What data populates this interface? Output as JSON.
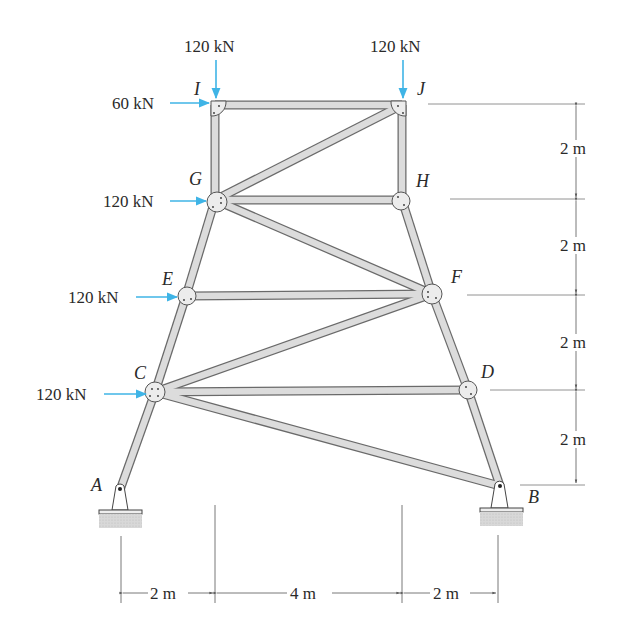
{
  "diagram": {
    "type": "truss",
    "joints": [
      {
        "id": "A",
        "x": 120,
        "y": 490,
        "label_x": 90,
        "label_y": 476
      },
      {
        "id": "B",
        "x": 500,
        "y": 486,
        "label_x": 527,
        "label_y": 488
      },
      {
        "id": "C",
        "x": 155,
        "y": 392,
        "label_x": 133,
        "label_y": 364
      },
      {
        "id": "D",
        "x": 468,
        "y": 390,
        "label_x": 480,
        "label_y": 364
      },
      {
        "id": "E",
        "x": 186,
        "y": 296,
        "label_x": 162,
        "label_y": 270
      },
      {
        "id": "F",
        "x": 432,
        "y": 294,
        "label_x": 450,
        "label_y": 268
      },
      {
        "id": "G",
        "x": 215,
        "y": 200,
        "label_x": 189,
        "label_y": 170
      },
      {
        "id": "H",
        "x": 402,
        "y": 200,
        "label_x": 416,
        "label_y": 172
      },
      {
        "id": "I",
        "x": 215,
        "y": 105,
        "label_x": 193,
        "label_y": 80
      },
      {
        "id": "J",
        "x": 402,
        "y": 105,
        "label_x": 416,
        "label_y": 80
      }
    ],
    "members": [
      [
        "I",
        "J"
      ],
      [
        "I",
        "G"
      ],
      [
        "J",
        "H"
      ],
      [
        "G",
        "J"
      ],
      [
        "G",
        "H"
      ],
      [
        "G",
        "E"
      ],
      [
        "H",
        "F"
      ],
      [
        "G",
        "F"
      ],
      [
        "E",
        "F"
      ],
      [
        "E",
        "C"
      ],
      [
        "F",
        "D"
      ],
      [
        "C",
        "F"
      ],
      [
        "C",
        "D"
      ],
      [
        "C",
        "A"
      ],
      [
        "D",
        "B"
      ],
      [
        "C",
        "B"
      ]
    ],
    "loads": [
      {
        "joint": "I",
        "value": "120 kN",
        "direction": "down",
        "label_x": 186,
        "label_y": 12
      },
      {
        "joint": "J",
        "value": "120 kN",
        "direction": "down",
        "label_x": 370,
        "label_y": 12
      },
      {
        "joint": "I",
        "value": "60 kN",
        "direction": "right",
        "label_x": 112,
        "label_y": 96
      },
      {
        "joint": "G",
        "value": "120 kN",
        "direction": "right",
        "label_x": 103,
        "label_y": 192
      },
      {
        "joint": "E",
        "value": "120 kN",
        "direction": "right",
        "label_x": 66,
        "label_y": 290
      },
      {
        "joint": "C",
        "value": "120 kN",
        "direction": "right",
        "label_x": 36,
        "label_y": 386
      }
    ],
    "supports": [
      {
        "joint": "A",
        "type": "pin"
      },
      {
        "joint": "B",
        "type": "pin"
      }
    ],
    "vertical_dimensions": [
      {
        "label": "2 m",
        "y1": 105,
        "y2": 200,
        "label_y": 145
      },
      {
        "label": "2 m",
        "y1": 200,
        "y2": 295,
        "label_y": 240
      },
      {
        "label": "2 m",
        "y1": 295,
        "y2": 390,
        "label_y": 336
      },
      {
        "label": "2 m",
        "y1": 390,
        "y2": 485,
        "label_y": 433
      }
    ],
    "horizontal_dimensions": [
      {
        "label": "2 m",
        "x1": 121,
        "x2": 215
      },
      {
        "label": "4 m",
        "x1": 215,
        "x2": 402
      },
      {
        "label": "2 m",
        "x1": 402,
        "x2": 498
      }
    ],
    "colors": {
      "load_arrow": "#3fb4e6",
      "member_fill": "#dcdcdc",
      "member_edge": "#6a6a6a",
      "text": "#2a2a2a",
      "dimension_line": "#777777",
      "ground_hatch": "#cfcfcf"
    }
  },
  "labels": {
    "load_I_down": "120 kN",
    "load_J_down": "120 kN",
    "load_I_right": "60 kN",
    "load_G_right": "120 kN",
    "load_E_right": "120 kN",
    "load_C_right": "120 kN",
    "joint_A": "A",
    "joint_B": "B",
    "joint_C": "C",
    "joint_D": "D",
    "joint_E": "E",
    "joint_F": "F",
    "joint_G": "G",
    "joint_H": "H",
    "joint_I": "I",
    "joint_J": "J",
    "dim_v1": "2 m",
    "dim_v2": "2 m",
    "dim_v3": "2 m",
    "dim_v4": "2 m",
    "dim_h1": "2 m",
    "dim_h2": "4 m",
    "dim_h3": "2 m"
  }
}
